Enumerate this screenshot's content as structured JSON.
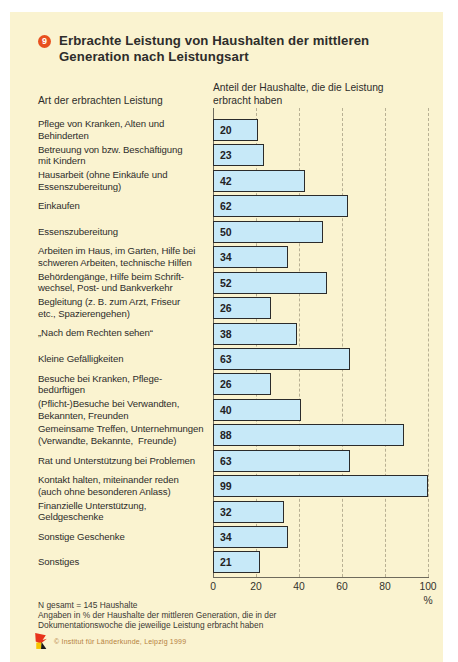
{
  "figure": {
    "number": "9",
    "title": "Erbrachte Leistung von Haushalten der mittleren\nGeneration nach Leistungsart",
    "left_header": "Art der erbrachten Leistung",
    "right_header": "Anteil der Haushalte, die die Leistung\nerbracht haben",
    "unit": "%",
    "footnotes": [
      "N gesamt = 145 Haushalte",
      "Angaben in % der Haushalte der mittleren Generation, die in der",
      "Dokumentationswoche die jeweilige Leistung erbracht haben"
    ],
    "copyright": "© Institut für Länderkunde, Leipzig 1999"
  },
  "chart_data": {
    "type": "bar",
    "orientation": "horizontal",
    "title": "Erbrachte Leistung von Haushalten der mittleren Generation nach Leistungsart",
    "xlabel": "%",
    "ylabel": "Art der erbrachten Leistung",
    "xlim": [
      0,
      100
    ],
    "xticks": [
      0,
      20,
      40,
      60,
      80,
      100
    ],
    "grid": "dashed-vertical",
    "value_labels": "inside-left",
    "categories": [
      "Pflege von Kranken, Alten und\nBehinderten",
      "Betreuung von bzw. Beschäftigung\nmit Kindern",
      "Hausarbeit (ohne Einkäufe und\nEssenszubereitung)",
      "Einkaufen",
      "Essenszubereitung",
      "Arbeiten im Haus, im Garten, Hilfe bei\nschweren Arbeiten, technische Hilfen",
      "Behördengänge, Hilfe beim Schrift-\nwechsel, Post- und Bankverkehr",
      "Begleitung (z. B. zum Arzt, Friseur\netc., Spazierengehen)",
      "„Nach dem Rechten sehen“",
      "Kleine Gefälligkeiten",
      "Besuche bei Kranken, Pflege-\nbedürftigen",
      "(Pflicht-)Besuche bei Verwandten,\nBekannten, Freunden",
      "Gemeinsame Treffen, Unternehmungen\n(Verwandte, Bekannte,  Freunde)",
      "Rat und Unterstützung bei Problemen",
      "Kontakt halten, miteinander reden\n(auch ohne besonderen Anlass)",
      "Finanzielle Unterstützung,\nGeldgeschenke",
      "Sonstige Geschenke",
      "Sonstiges"
    ],
    "values": [
      20,
      23,
      42,
      62,
      50,
      34,
      52,
      26,
      38,
      63,
      26,
      40,
      88,
      63,
      99,
      32,
      34,
      21
    ]
  },
  "colors": {
    "page_bg": "#ffffff",
    "card_bg": "#faf3d0",
    "bar_fill": "#c7e9f8",
    "bar_border": "#2b2b2b",
    "grid": "#b8b093",
    "axis": "#6e6a5c",
    "text": "#2e2d2b",
    "badge": "#e8501e",
    "credit": "#b5813e"
  }
}
